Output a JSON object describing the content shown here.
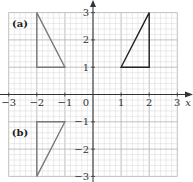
{
  "diagram": {
    "type": "coordinate-grid",
    "x_range": [
      -3,
      3
    ],
    "y_range": [
      -3,
      3
    ],
    "minor_subdivisions": 5,
    "axis_labels": {
      "x": "x",
      "y": "y"
    },
    "x_ticks": [
      "−3",
      "−2",
      "−1",
      "1",
      "2",
      "3"
    ],
    "x_tick_values": [
      -3,
      -2,
      -1,
      1,
      2,
      3
    ],
    "y_ticks": [
      "3",
      "2",
      "1",
      "−1",
      "−2",
      "−3"
    ],
    "y_tick_values": [
      3,
      2,
      1,
      -1,
      -2,
      -3
    ],
    "origin_label": "0",
    "colors": {
      "grid_minor": "#d6d6d6",
      "grid_major": "#b0b0b0",
      "axis": "#333333",
      "shape_grey": "#7a7a7a",
      "shape_dark": "#222222"
    },
    "shapes": [
      {
        "label": "(a)",
        "vertices": [
          [
            -2,
            3
          ],
          [
            -2,
            1
          ],
          [
            -1,
            1
          ]
        ],
        "color": "#7a7a7a",
        "label_pos": [
          -2.6,
          2.6
        ]
      },
      {
        "label": "",
        "vertices": [
          [
            1,
            1
          ],
          [
            2,
            1
          ],
          [
            2,
            3
          ]
        ],
        "color": "#222222"
      },
      {
        "label": "(b)",
        "vertices": [
          [
            -2,
            -1
          ],
          [
            -1,
            -1
          ],
          [
            -2,
            -3
          ]
        ],
        "color": "#7a7a7a",
        "label_pos": [
          -2.6,
          -1.4
        ]
      }
    ]
  }
}
